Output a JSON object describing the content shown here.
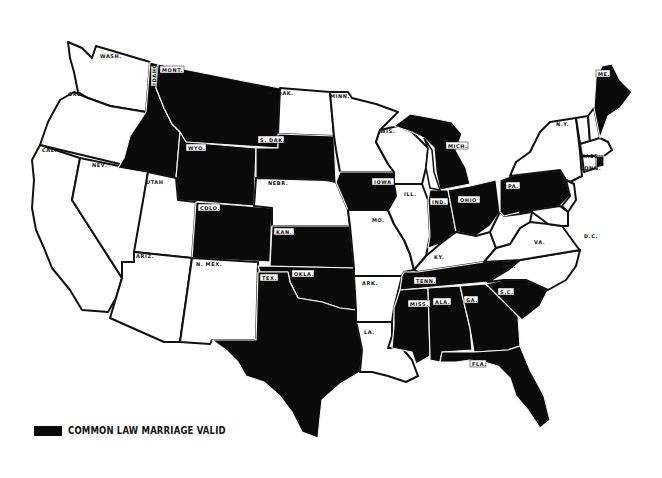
{
  "map": {
    "title": "Common Law Marriage Validity in the United States",
    "colors": {
      "valid": "#0a0a0a",
      "invalid": "#ffffff",
      "border": "#111111"
    },
    "legend": {
      "label": "COMMON LAW MARRIAGE VALID",
      "swatch_color": "#0a0a0a"
    },
    "states": [
      {
        "abbr": "WASH.",
        "valid": false
      },
      {
        "abbr": "ORE.",
        "valid": false
      },
      {
        "abbr": "CAL.",
        "valid": false
      },
      {
        "abbr": "NEV.",
        "valid": false
      },
      {
        "abbr": "IDAHO",
        "valid": true
      },
      {
        "abbr": "MONT.",
        "valid": true
      },
      {
        "abbr": "WYO.",
        "valid": true
      },
      {
        "abbr": "UTAH",
        "valid": false
      },
      {
        "abbr": "ARIZ.",
        "valid": false
      },
      {
        "abbr": "COLO.",
        "valid": true
      },
      {
        "abbr": "N. MEX.",
        "valid": false
      },
      {
        "abbr": "N. DAK.",
        "valid": false
      },
      {
        "abbr": "S. DAK.",
        "valid": true
      },
      {
        "abbr": "NEBR.",
        "valid": false
      },
      {
        "abbr": "KAN.",
        "valid": true
      },
      {
        "abbr": "OKLA.",
        "valid": true
      },
      {
        "abbr": "TEX.",
        "valid": true
      },
      {
        "abbr": "MINN.",
        "valid": false
      },
      {
        "abbr": "IOWA",
        "valid": true
      },
      {
        "abbr": "MO.",
        "valid": false
      },
      {
        "abbr": "ARK.",
        "valid": false
      },
      {
        "abbr": "LA.",
        "valid": false
      },
      {
        "abbr": "WIS.",
        "valid": false
      },
      {
        "abbr": "ILL.",
        "valid": false
      },
      {
        "abbr": "MICH.",
        "valid": true
      },
      {
        "abbr": "IND.",
        "valid": true
      },
      {
        "abbr": "OHIO",
        "valid": true
      },
      {
        "abbr": "KY.",
        "valid": false
      },
      {
        "abbr": "TENN.",
        "valid": true
      },
      {
        "abbr": "MISS.",
        "valid": true
      },
      {
        "abbr": "ALA.",
        "valid": true
      },
      {
        "abbr": "GA.",
        "valid": true
      },
      {
        "abbr": "FLA.",
        "valid": true
      },
      {
        "abbr": "S.C.",
        "valid": true
      },
      {
        "abbr": "N.C.",
        "valid": false
      },
      {
        "abbr": "VA.",
        "valid": false
      },
      {
        "abbr": "W. VA.",
        "valid": false
      },
      {
        "abbr": "PA.",
        "valid": true
      },
      {
        "abbr": "N.Y.",
        "valid": false
      },
      {
        "abbr": "N.J.",
        "valid": false
      },
      {
        "abbr": "DEL.",
        "valid": false
      },
      {
        "abbr": "MD.",
        "valid": false
      },
      {
        "abbr": "VT.",
        "valid": false
      },
      {
        "abbr": "N.H.",
        "valid": false
      },
      {
        "abbr": "MASS.",
        "valid": false
      },
      {
        "abbr": "CONN.",
        "valid": false
      },
      {
        "abbr": "R.I.",
        "valid": true
      },
      {
        "abbr": "ME.",
        "valid": true
      }
    ]
  },
  "labels": {
    "wash": "WASH.",
    "ore": "ORE.",
    "cal": "CAL.",
    "nev": "NEV.",
    "idaho": "IDAHO",
    "mont": "MONT.",
    "wyo": "WYO.",
    "utah": "UTAH",
    "ariz": "ARIZ.",
    "colo": "COLO.",
    "nmex": "N. MEX.",
    "ndak": "N. DAK.",
    "sdak": "S. DAK.",
    "nebr": "NEBR.",
    "kan": "KAN.",
    "okla": "OKLA.",
    "tex": "TEX.",
    "minn": "MINN.",
    "iowa": "IOWA",
    "mo": "MO.",
    "ark": "ARK.",
    "la": "LA.",
    "wis": "WIS.",
    "ill": "ILL.",
    "mich": "MICH.",
    "ind": "IND.",
    "ohio": "OHIO",
    "ky": "KY.",
    "tenn": "TENN.",
    "miss": "MISS.",
    "ala": "ALA.",
    "ga": "GA.",
    "fla": "FLA.",
    "sc": "S.C.",
    "nc": "N.C.",
    "va": "VA.",
    "wva": "W.VA.",
    "pa": "PA.",
    "ny": "N.Y.",
    "nj": "N.J.",
    "vt": "VT.",
    "nh": "N.H.",
    "mass": "MASS.",
    "conn": "CONN.",
    "me": "ME.",
    "dc": "D.C."
  }
}
